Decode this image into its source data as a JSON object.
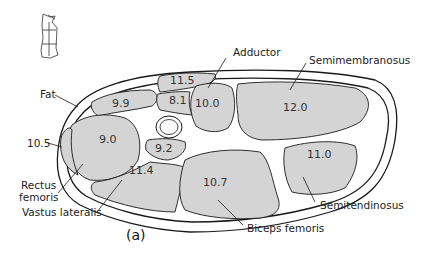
{
  "figure": {
    "panel_label": "(a)",
    "colors": {
      "muscle_fill": "#d4d4d4",
      "outline": "#1a1a1a",
      "background": "#ffffff"
    },
    "labels": {
      "fat": "Fat",
      "adductor": "Adductor",
      "semimembranosus": "Semimembranosus",
      "rectus_femoris_1": "Rectus",
      "rectus_femoris_2": "femoris",
      "vastus_lateralis": "Vastus lateralis",
      "biceps_femoris": "Biceps femoris",
      "semitendinosus": "Semitendinosus",
      "value_10_5": "10.5"
    },
    "regions": [
      {
        "name": "upper-left-muscle",
        "value": "9.9"
      },
      {
        "name": "adductor-upper",
        "value": "11.5"
      },
      {
        "name": "adductor-small",
        "value": "8.1"
      },
      {
        "name": "adductor",
        "value": "10.0"
      },
      {
        "name": "semimembranosus",
        "value": "12.0"
      },
      {
        "name": "rectus-femoris",
        "value": "9.0"
      },
      {
        "name": "vastus-intermedius",
        "value": "9.2"
      },
      {
        "name": "vastus-lateralis",
        "value": "11.4"
      },
      {
        "name": "biceps-femoris",
        "value": "10.7"
      },
      {
        "name": "semitendinosus",
        "value": "11.0"
      }
    ]
  }
}
